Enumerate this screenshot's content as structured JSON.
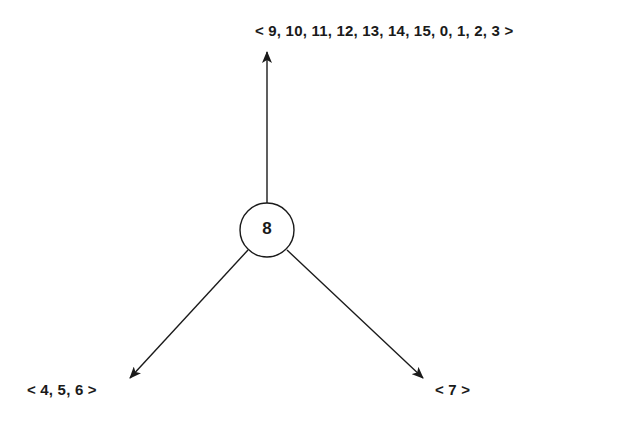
{
  "diagram": {
    "type": "tree",
    "root": {
      "label": "8"
    },
    "children": [
      {
        "position": "top",
        "label": "< 9, 10, 11, 12, 13, 14, 15, 0, 1, 2, 3 >"
      },
      {
        "position": "bottom-left",
        "label": "< 4, 5, 6 >"
      },
      {
        "position": "bottom-right",
        "label": "< 7 >"
      }
    ],
    "colors": {
      "stroke": "#1a1a1a",
      "background": "#ffffff"
    }
  }
}
